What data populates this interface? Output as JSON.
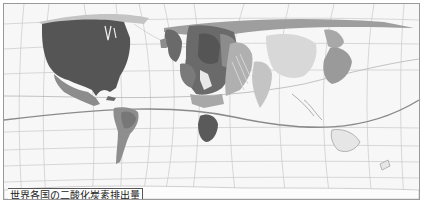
{
  "map": {
    "caption": "世界各国の二酸化炭素排出量",
    "type": "cartogram",
    "subject": "CO2 emissions by country",
    "colors": {
      "background": "#f7f7f7",
      "grid": "#c8c8c8",
      "equator": "#8a8a8a",
      "usa": "#555555",
      "europe_dark": "#6a6a6a",
      "europe_mid": "#8c8c8c",
      "russia": "#9e9e9e",
      "latin_america": "#8e8e8e",
      "east_asia": "#a8a8a8",
      "light": "#c4c4c4",
      "south_africa": "#5a5a5a"
    }
  }
}
